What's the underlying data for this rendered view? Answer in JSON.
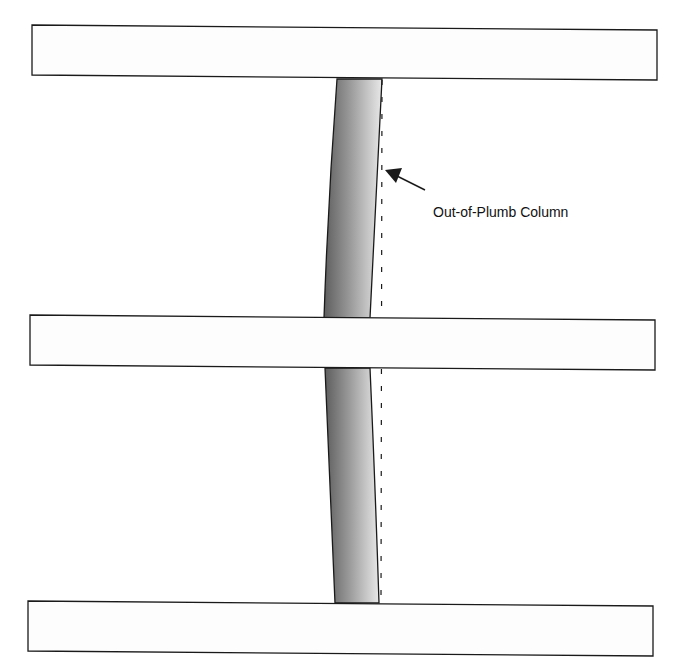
{
  "diagram": {
    "label": "Out-of-Plumb Column",
    "colors": {
      "stroke": "#1a1a1a",
      "beam_fill": "#fdfdfd",
      "column_dark": "#6e6e6e",
      "column_light": "#e4e4e4",
      "background": "#ffffff"
    },
    "beams": [
      {
        "name": "top-beam"
      },
      {
        "name": "middle-beam"
      },
      {
        "name": "bottom-beam"
      }
    ],
    "column_segments": [
      {
        "name": "upper-column-segment"
      },
      {
        "name": "lower-column-segment"
      }
    ]
  }
}
